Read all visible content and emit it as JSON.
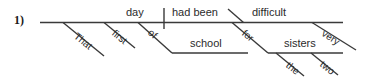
{
  "item": {
    "number_label": "1)"
  },
  "diagram": {
    "type": "reed-kellogg-sentence-diagram",
    "sentence": "That first day of school had been very difficult for the two sisters.",
    "line_color": "#3a3a3a",
    "text_color": "#2b2b2b",
    "background": "#ffffff",
    "words": {
      "subject": "day",
      "verb": "had been",
      "predicate_adjective": "difficult",
      "subject_modifier_1": "That",
      "subject_modifier_2": "first",
      "subject_preposition": "of",
      "subject_prep_object": "school",
      "adjective_modifier": "very",
      "predicate_preposition": "for",
      "predicate_prep_object": "sisters",
      "object_modifier_1": "the",
      "object_modifier_2": "two"
    },
    "labels": [
      {
        "name": "day",
        "text": "day"
      },
      {
        "name": "had-been",
        "text": "had been"
      },
      {
        "name": "difficult",
        "text": "difficult"
      },
      {
        "name": "that",
        "text": "That"
      },
      {
        "name": "first",
        "text": "first"
      },
      {
        "name": "of",
        "text": "of"
      },
      {
        "name": "school",
        "text": "school"
      },
      {
        "name": "very",
        "text": "very"
      },
      {
        "name": "for",
        "text": "for"
      },
      {
        "name": "sisters",
        "text": "sisters"
      },
      {
        "name": "the",
        "text": "the"
      },
      {
        "name": "two",
        "text": "two"
      }
    ]
  }
}
